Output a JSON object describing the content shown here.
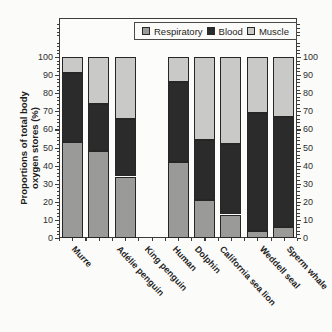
{
  "chart_data": {
    "type": "bar",
    "stacked": true,
    "title": "",
    "xlabel": "",
    "ylabel_line1": "Proportions of total body",
    "ylabel_line2": "oxygen stores (%)",
    "ylim": [
      0,
      100
    ],
    "ytick_labels": [
      "0",
      "10",
      "20",
      "30",
      "40",
      "50",
      "60",
      "70",
      "80",
      "90",
      "100"
    ],
    "minor_tick_step": 2,
    "grid": false,
    "dual_y_axis_labels": true,
    "legend_position": "top-inside",
    "categories": [
      "Murre",
      "Adélie penguin",
      "King penguin",
      "Human",
      "Dolphin",
      "California sea lion",
      "Weddell seal",
      "Sperm whale"
    ],
    "category_group_gap_after": "King penguin",
    "series": [
      {
        "name": "Respiratory",
        "color": "#9a9a98",
        "values": [
          53,
          48,
          34,
          42,
          21,
          13,
          4,
          6
        ]
      },
      {
        "name": "Blood",
        "color": "#2b2b2b",
        "values": [
          38,
          26,
          32,
          44,
          33,
          39,
          65,
          61
        ]
      },
      {
        "name": "Muscle",
        "color": "#c9c9c7",
        "values": [
          9,
          26,
          34,
          14,
          46,
          48,
          31,
          33
        ]
      }
    ]
  }
}
